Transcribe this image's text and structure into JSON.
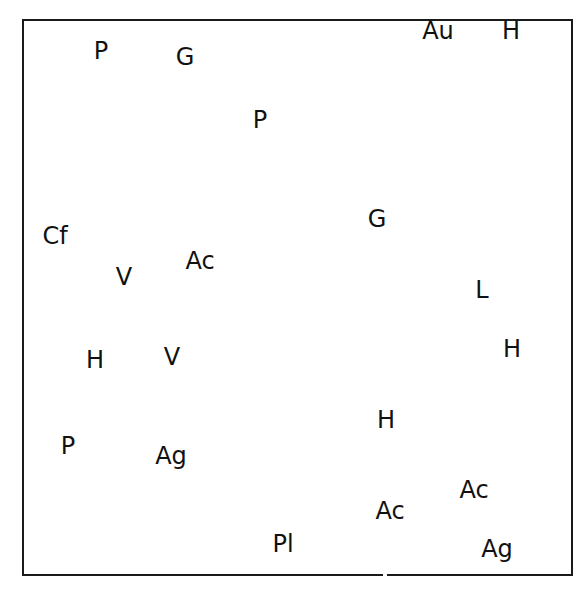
{
  "diagram": {
    "colors": {
      "ink": "#111111",
      "background": "#ffffff"
    },
    "labels": [
      {
        "text": "P"
      },
      {
        "text": "G"
      },
      {
        "text": "Au"
      },
      {
        "text": "H"
      },
      {
        "text": "P"
      },
      {
        "text": "G"
      },
      {
        "text": "Cf"
      },
      {
        "text": "Ac"
      },
      {
        "text": "V"
      },
      {
        "text": "L"
      },
      {
        "text": "H"
      },
      {
        "text": "V"
      },
      {
        "text": "H"
      },
      {
        "text": "H"
      },
      {
        "text": "P"
      },
      {
        "text": "Ag"
      },
      {
        "text": "Ac"
      },
      {
        "text": "Ac"
      },
      {
        "text": "Pl"
      },
      {
        "text": "Ag"
      }
    ]
  }
}
